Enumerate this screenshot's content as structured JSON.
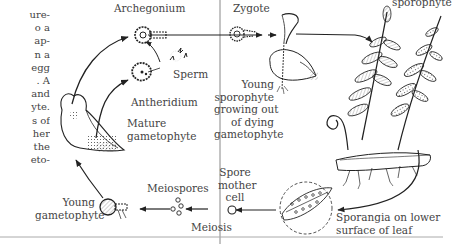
{
  "figure": {
    "type": "fern life cycle diagram",
    "left_text_fragment": [
      "ure-",
      "o a",
      "ap-",
      "n a",
      "egg",
      ". A",
      "and",
      "yte.",
      "s of",
      "her",
      "the",
      "eto-"
    ],
    "labels": {
      "archegonium": "Archegonium",
      "sperm": "Sperm",
      "antheridium": "Antheridium",
      "mature_gametophyte": [
        "Mature",
        "gametophyte"
      ],
      "young_gametophyte": [
        "Young",
        "gametophyte"
      ],
      "meiospores": "Meiospores",
      "meiosis": "Meiosis",
      "spore_mother_cell": [
        "Spore",
        "mother",
        "cell"
      ],
      "zygote": "Zygote",
      "young_sporophyte": [
        "Young",
        "sporophyte",
        "growing out",
        "of dying",
        "gametophyte"
      ],
      "mature_sporophyte": "sporophyte",
      "sporangia": [
        "Sporangia on lower",
        "surface of leaf"
      ]
    },
    "cycle_order": [
      "Young gametophyte",
      "Mature gametophyte",
      "Antheridium",
      "Sperm",
      "Archegonium",
      "Zygote",
      "Young sporophyte",
      "Mature sporophyte",
      "Sporangia",
      "Spore mother cell",
      "Meiospores",
      "Young gametophyte"
    ],
    "phase_divider": "Meiosis / Fertilization boundary",
    "colors": {
      "ink": "#222222",
      "text": "#444444",
      "divider": "#888888",
      "background": "#ffffff"
    }
  }
}
